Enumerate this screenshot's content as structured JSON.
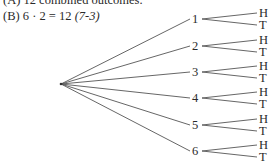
{
  "text": {
    "line_a": "(A) 12 combined outcomes.",
    "line_b_label": "(B)",
    "line_b_expr": "6 · 2 = 12",
    "line_b_ref": "(7-3)"
  },
  "tree": {
    "root": {
      "x": 61,
      "y": 84
    },
    "branches": [
      {
        "label": "1",
        "y": 19,
        "outcomes": [
          "H",
          "T"
        ]
      },
      {
        "label": "2",
        "y": 46,
        "outcomes": [
          "H",
          "T"
        ]
      },
      {
        "label": "3",
        "y": 72,
        "outcomes": [
          "H",
          "T"
        ]
      },
      {
        "label": "4",
        "y": 98,
        "outcomes": [
          "H",
          "T"
        ]
      },
      {
        "label": "5",
        "y": 125,
        "outcomes": [
          "H",
          "T"
        ]
      },
      {
        "label": "6",
        "y": 151,
        "outcomes": [
          "H",
          "T"
        ]
      }
    ]
  }
}
